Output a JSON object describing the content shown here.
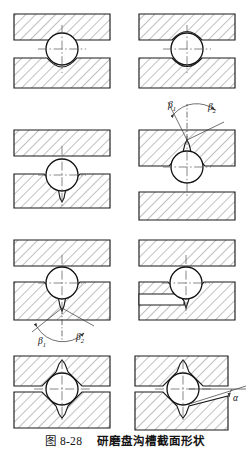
{
  "figure": {
    "number_label": "图 8-28",
    "title": "研磨盘沟槽截面形状",
    "caption_full": "图 8-28  研磨盘沟槽截面形状"
  },
  "style": {
    "outline_color": "#1a1a1a",
    "hatch_color": "#4a4a4a",
    "centerline_color": "#555555",
    "ball_color": "#111111",
    "background": "#ffffff"
  },
  "panels": [
    {
      "id": "panel-1",
      "position": "row1-left",
      "upper_block": "flat",
      "lower_block": "shallow-concave-arc",
      "annotations": []
    },
    {
      "id": "panel-2",
      "position": "row1-right",
      "upper_block": "shallow-concave-arc",
      "lower_block": "shallow-concave-arc",
      "annotations": []
    },
    {
      "id": "panel-3",
      "position": "row2-left",
      "upper_block": "flat",
      "lower_block": "v-groove-chamfered",
      "annotations": []
    },
    {
      "id": "panel-4",
      "position": "row2-right",
      "upper_block": "v-groove-chamfered-inverted",
      "lower_block": "flat",
      "annotations": [
        "beta1",
        "beta2"
      ]
    },
    {
      "id": "panel-5",
      "position": "row3-left",
      "upper_block": "flat",
      "lower_block": "v-groove-chamfered",
      "annotations": [
        "beta1",
        "beta2"
      ]
    },
    {
      "id": "panel-6",
      "position": "row3-right",
      "upper_block": "flat",
      "lower_block": "v-groove-with-horizontal-slot",
      "annotations": []
    },
    {
      "id": "panel-7",
      "position": "row4-left",
      "upper_block": "v-groove-chamfered-inverted",
      "lower_block": "v-groove-chamfered",
      "annotations": []
    },
    {
      "id": "panel-8",
      "position": "row4-right",
      "upper_block": "v-groove-chamfered-inverted",
      "lower_block": "v-groove-inclined-surface",
      "annotations": [
        "alpha"
      ]
    }
  ],
  "labels": {
    "beta1": "β",
    "beta1_sub": "1",
    "beta2": "β",
    "beta2_sub": "2",
    "alpha": "α"
  }
}
